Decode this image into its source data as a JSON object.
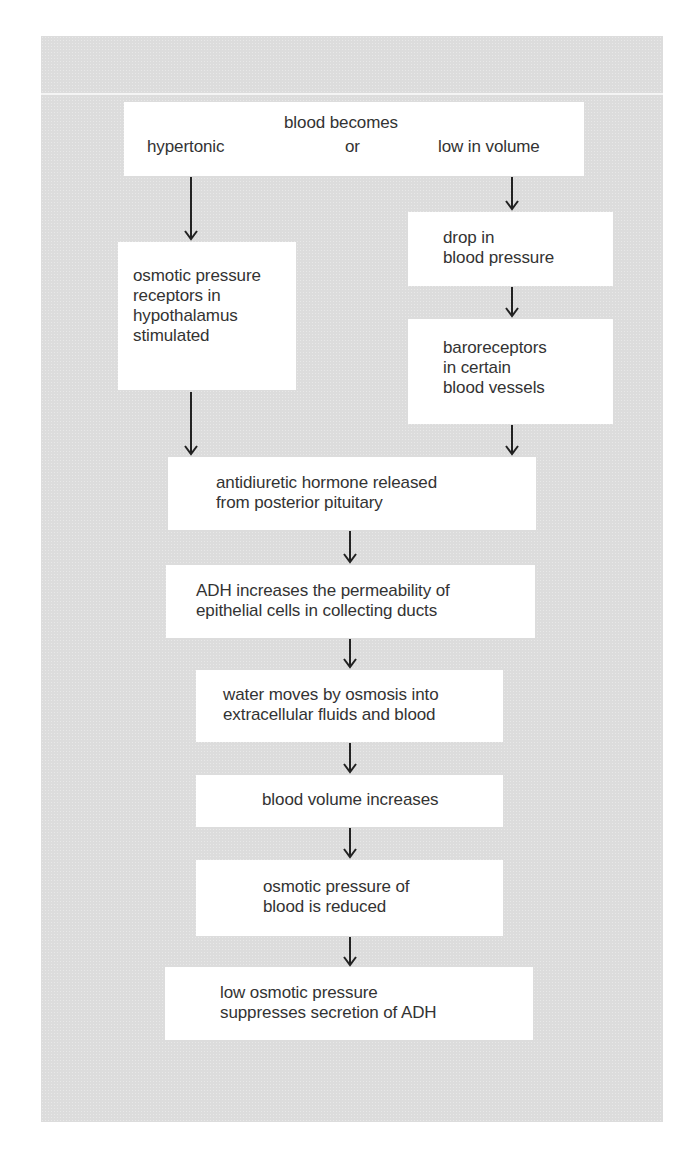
{
  "diagram": {
    "type": "flowchart",
    "title": "",
    "colors": {
      "panel_bg": "#dcdcdc",
      "box_bg": "#ffffff",
      "text": "#333333",
      "arrow": "#222222"
    },
    "start": {
      "heading": "blood becomes",
      "left_condition": "hypertonic",
      "connector": "or",
      "right_condition": "low in volume"
    },
    "left_branch": {
      "box1": [
        "osmotic pressure",
        "receptors in",
        "hypothalamus",
        "stimulated"
      ]
    },
    "right_branch": {
      "box1": [
        "drop in",
        "blood pressure"
      ],
      "box2": [
        "baroreceptors",
        "in certain",
        "blood vessels"
      ]
    },
    "main_steps": [
      [
        "antidiuretic hormone released",
        "from posterior pituitary"
      ],
      [
        "ADH increases the permeability of",
        "epithelial cells in collecting ducts"
      ],
      [
        "water moves by osmosis into",
        "extracellular fluids and blood"
      ],
      [
        "blood volume increases"
      ],
      [
        "osmotic pressure of",
        "blood is reduced"
      ],
      [
        "low osmotic pressure",
        "suppresses secretion of ADH"
      ]
    ]
  }
}
